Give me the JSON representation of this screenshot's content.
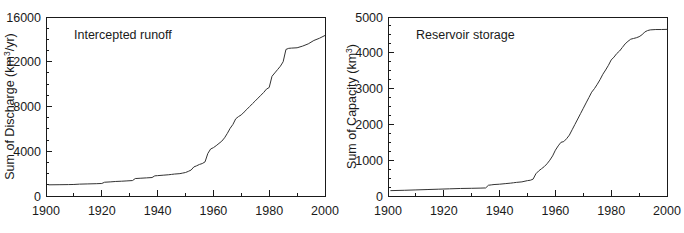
{
  "figure": {
    "background_color": "#ffffff",
    "line_color": "#333333",
    "axis_color": "#1a1a1a"
  },
  "chart_data": [
    {
      "type": "line",
      "panel_id": "left",
      "title": "Intercepted runoff",
      "xlabel": "",
      "ylabel": "Sum of Discharge (km3/yr)",
      "ylabel_main": "Sum of Discharge (km",
      "ylabel_sup": "3",
      "ylabel_tail": "/yr)",
      "xlim": [
        1900,
        2000
      ],
      "ylim": [
        0,
        16000
      ],
      "xticks": [
        1900,
        1920,
        1940,
        1960,
        1980,
        2000
      ],
      "xticklabels": [
        "1900",
        "1920",
        "1940",
        "1960",
        "1980",
        "2000"
      ],
      "yticks": [
        0,
        4000,
        8000,
        12000,
        16000
      ],
      "yticklabels": [
        "0",
        "4000",
        "8000",
        "12000",
        "16000"
      ],
      "x_minor_step": 10,
      "y_minor_step": 1000,
      "grid": false,
      "legend": "none",
      "series": [
        {
          "name": "Cumulative intercepted runoff",
          "x": [
            1901,
            1905,
            1908,
            1910,
            1912,
            1915,
            1918,
            1920,
            1921,
            1923,
            1925,
            1927,
            1929,
            1931,
            1932,
            1934,
            1936,
            1938,
            1939,
            1940,
            1942,
            1944,
            1945,
            1946,
            1948,
            1949,
            1950,
            1951,
            1952,
            1953,
            1954,
            1955,
            1956,
            1957,
            1958,
            1959,
            1960,
            1961,
            1962,
            1963,
            1964,
            1965,
            1966,
            1967,
            1968,
            1969,
            1970,
            1971,
            1972,
            1973,
            1974,
            1975,
            1976,
            1977,
            1978,
            1979,
            1980,
            1981,
            1982,
            1983,
            1984,
            1985,
            1986,
            1987,
            1988,
            1990,
            1992,
            1994,
            1996,
            1998,
            2000
          ],
          "y": [
            1000,
            1010,
            1020,
            1030,
            1060,
            1080,
            1100,
            1120,
            1230,
            1260,
            1300,
            1320,
            1350,
            1380,
            1560,
            1590,
            1620,
            1650,
            1800,
            1820,
            1860,
            1900,
            1930,
            1960,
            2000,
            2050,
            2100,
            2200,
            2320,
            2600,
            2700,
            2820,
            2900,
            3050,
            3800,
            4200,
            4320,
            4500,
            4700,
            4900,
            5200,
            5600,
            6050,
            6400,
            6900,
            7100,
            7250,
            7500,
            7750,
            8000,
            8250,
            8500,
            8750,
            9000,
            9250,
            9550,
            9700,
            10700,
            11000,
            11300,
            11600,
            12000,
            13100,
            13200,
            13220,
            13250,
            13400,
            13600,
            13900,
            14100,
            14350
          ]
        }
      ]
    },
    {
      "type": "line",
      "panel_id": "right",
      "title": "Reservoir storage",
      "xlabel": "",
      "ylabel": "Sum of Capacity (km3)",
      "ylabel_main": "Sum of Capacity (km",
      "ylabel_sup": "3",
      "ylabel_tail": ")",
      "xlim": [
        1900,
        2000
      ],
      "ylim": [
        0,
        5000
      ],
      "xticks": [
        1900,
        1920,
        1940,
        1960,
        1980,
        2000
      ],
      "xticklabels": [
        "1900",
        "1920",
        "1940",
        "1960",
        "1980",
        "2000"
      ],
      "yticks": [
        0,
        1000,
        2000,
        3000,
        4000,
        5000
      ],
      "yticklabels": [
        "0",
        "1000",
        "2000",
        "3000",
        "4000",
        "5000"
      ],
      "x_minor_step": 10,
      "y_minor_step": 250,
      "grid": false,
      "legend": "none",
      "series": [
        {
          "name": "Cumulative reservoir storage capacity",
          "x": [
            1901,
            1906,
            1910,
            1914,
            1918,
            1922,
            1926,
            1930,
            1933,
            1935,
            1936,
            1937,
            1938,
            1940,
            1942,
            1944,
            1945,
            1946,
            1948,
            1950,
            1951,
            1952,
            1953,
            1954,
            1955,
            1956,
            1957,
            1958,
            1959,
            1960,
            1961,
            1962,
            1963,
            1964,
            1965,
            1966,
            1967,
            1968,
            1969,
            1970,
            1971,
            1972,
            1973,
            1974,
            1975,
            1976,
            1977,
            1978,
            1979,
            1980,
            1981,
            1982,
            1983,
            1984,
            1985,
            1986,
            1987,
            1988,
            1989,
            1990,
            1991,
            1992,
            1993,
            1994,
            1996,
            1998,
            2000
          ],
          "y": [
            150,
            160,
            170,
            180,
            190,
            200,
            210,
            215,
            220,
            225,
            300,
            310,
            320,
            330,
            345,
            360,
            370,
            380,
            395,
            430,
            440,
            470,
            620,
            700,
            760,
            820,
            900,
            1000,
            1120,
            1280,
            1400,
            1500,
            1520,
            1600,
            1700,
            1850,
            2000,
            2150,
            2300,
            2450,
            2600,
            2750,
            2900,
            3000,
            3120,
            3250,
            3400,
            3520,
            3650,
            3800,
            3880,
            3980,
            4050,
            4150,
            4250,
            4320,
            4380,
            4400,
            4420,
            4450,
            4500,
            4580,
            4620,
            4640,
            4650,
            4650,
            4655
          ]
        }
      ]
    }
  ]
}
